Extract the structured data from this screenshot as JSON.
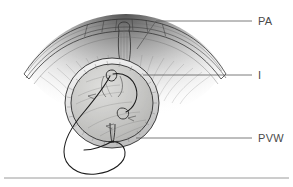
{
  "figure": {
    "type": "anatomical-line-illustration",
    "background_color": "#ffffff",
    "ink_color": "#2e2e2e",
    "label_color": "#4a4a4a",
    "leader_color": "#5a5a5a",
    "rule_color": "#808080"
  },
  "labels": [
    {
      "id": "pa",
      "text": "PA",
      "meaning": "pulmonary artery",
      "x": 258,
      "y": 24,
      "leader": "M 137 49 L 156 21 L 252 21"
    },
    {
      "id": "i",
      "text": "I",
      "meaning": "incision",
      "x": 258,
      "y": 79,
      "leader": "M 143 75 L 252 75"
    },
    {
      "id": "pvw",
      "text": "PVW",
      "meaning": "posterior vessel wall",
      "x": 258,
      "y": 142,
      "leader": "M 136 138 L 252 138"
    }
  ],
  "rule": {
    "name": "bottom-divider",
    "x1": 4,
    "y1": 178,
    "x2": 289,
    "y2": 178
  },
  "shapes": {
    "vessel_disc": {
      "cx": 112,
      "cy": 103,
      "rx": 47,
      "ry": 45,
      "rim_thickness": 6,
      "fill": "#c9c9c9"
    },
    "arch_band": {
      "description": "curved arterial band spanning upper portion",
      "left_end_x": 24,
      "right_end_x": 226,
      "apex_y": 33
    },
    "suture_loop": {
      "description": "thread exiting disc and looping below",
      "lowest_y": 174
    }
  }
}
